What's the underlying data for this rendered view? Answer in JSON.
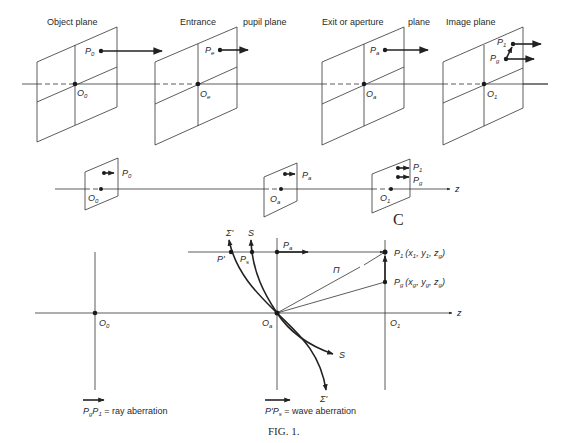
{
  "figure": {
    "caption": "FIG. 1.",
    "colors": {
      "ink": "#222222",
      "background": "#ffffff"
    }
  },
  "top_row": {
    "planes": [
      {
        "title": "Object plane",
        "point": "P",
        "point_sub": "0",
        "origin": "O",
        "origin_sub": "0"
      },
      {
        "title": "Entrance",
        "title2": "pupil plane",
        "point": "P",
        "point_sub": "e",
        "origin": "O",
        "origin_sub": "e"
      },
      {
        "title": "Exit or aperture",
        "title2": "plane",
        "point": "P",
        "point_sub": "a",
        "origin": "O",
        "origin_sub": "a"
      },
      {
        "title": "Image plane",
        "point": "P",
        "point_sub": "1",
        "point2": "P",
        "point2_sub": "g",
        "origin": "O",
        "origin_sub": "1"
      }
    ]
  },
  "middle_row": {
    "planes": [
      {
        "point": "P",
        "point_sub": "0",
        "origin": "O",
        "origin_sub": "0"
      },
      {
        "point": "P",
        "point_sub": "a",
        "origin": "O",
        "origin_sub": "a"
      },
      {
        "point": "P",
        "point_sub": "1",
        "point2": "P",
        "point2_sub": "g",
        "origin": "O",
        "origin_sub": "1"
      }
    ],
    "axis_label": "z",
    "stray_mark": "C"
  },
  "bottom_diagram": {
    "axis_label": "z",
    "origins": [
      {
        "label": "O",
        "sub": "0"
      },
      {
        "label": "O",
        "sub": "a"
      },
      {
        "label": "O",
        "sub": "1"
      }
    ],
    "points": {
      "p_prime": "P'",
      "p_s": {
        "label": "P",
        "sub": "s"
      },
      "p_a": {
        "label": "P",
        "sub": "a"
      },
      "p1": {
        "label": "P",
        "sub": "1",
        "coords": "(x",
        "c1": "1",
        "c2": ", y",
        "c3": "1",
        "c4": ", z",
        "c5": "g",
        "c6": ")"
      },
      "pg": {
        "label": "P",
        "sub": "g",
        "coords": "(x",
        "c1": "g",
        "c2": ", y",
        "c3": "g",
        "c4": ", z",
        "c5": "g",
        "c6": ")"
      }
    },
    "curves": {
      "sigma_top": "Σ'",
      "s_top": "S",
      "s_bottom": "S",
      "sigma_bottom": "Σ'"
    },
    "ray_label": "Π"
  },
  "legend": [
    {
      "vector_a": "P",
      "sub_a": "g",
      "vector_b": "P",
      "sub_b": "1",
      "text": " = ray aberration"
    },
    {
      "vector_a": "P'",
      "sub_a": "",
      "vector_b": "P",
      "sub_b": "s",
      "text": " = wave aberration"
    }
  ]
}
